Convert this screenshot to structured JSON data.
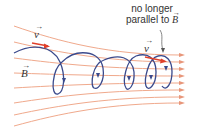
{
  "diagram": {
    "labels": {
      "velocity_left": "v",
      "velocity_right": "v",
      "field": "B",
      "vector_arrow": "→",
      "note_line1": "no longer",
      "note_line2_prefix": "parallel to ",
      "note_line2_symbol": "B"
    },
    "colors": {
      "field_line": "#f0a98c",
      "field_arrow": "#e8967a",
      "trajectory": "#3b4a8c",
      "velocity_arrow": "#e0402a",
      "text": "#333333"
    },
    "field_line_count": 8,
    "trajectory_loops": 4
  }
}
